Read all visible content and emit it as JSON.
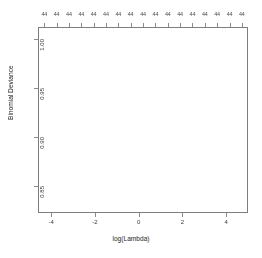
{
  "plot": {
    "xlabel": "log(Lambda)",
    "ylabel": "Binomial Deviance",
    "x_ticks": [
      "-4",
      "-2",
      "0",
      "2",
      "4"
    ],
    "x_tick_values": [
      -4,
      -2,
      0,
      2,
      4
    ],
    "y_ticks": [
      "0.85",
      "0.90",
      "0.95",
      "1.00"
    ],
    "y_tick_values": [
      0.85,
      0.9,
      0.95,
      1.0
    ],
    "top_axis_labels": [
      "44",
      "44",
      "44",
      "44",
      "44",
      "44",
      "44",
      "44",
      "44",
      "44",
      "44",
      "44",
      "44",
      "44",
      "44",
      "44",
      "44"
    ],
    "frame_color": "#7d7d7d",
    "point_color": "#1a1a1a",
    "errorbar_color": "#9d9d9d",
    "vline_color": "#8c8c8c"
  },
  "chart_data": {
    "type": "line",
    "title": "",
    "xlabel": "log(Lambda)",
    "ylabel": "Binomial Deviance",
    "xlim": [
      -4.6,
      5.0
    ],
    "ylim": [
      0.822,
      1.012
    ],
    "grid": false,
    "legend": null,
    "top_axis_label_text": "44",
    "top_axis_label_count": 17,
    "vertical_lines": [
      -4.35,
      -3.1
    ],
    "series": [
      {
        "name": "Binomial Deviance (mean CV)",
        "x": [
          -4.35,
          -4.25,
          -4.15,
          -4.05,
          -3.95,
          -3.85,
          -3.75,
          -3.65,
          -3.55,
          -3.45,
          -3.35,
          -3.25,
          -3.15,
          -3.05,
          -2.95,
          -2.85,
          -2.75,
          -2.65,
          -2.55,
          -2.45,
          -2.35,
          -2.25,
          -2.15,
          -2.05,
          -1.95,
          -1.85,
          -1.75,
          -1.65,
          -1.55,
          -1.45,
          -1.35,
          -1.25,
          -1.15,
          -1.05,
          -0.95,
          -0.85,
          -0.75,
          -0.65,
          -0.55,
          -0.45,
          -0.35,
          -0.25,
          -0.15,
          -0.05,
          0.05,
          0.15,
          0.25,
          0.35,
          0.45,
          0.55,
          0.65,
          0.75,
          0.85,
          0.95,
          1.05,
          1.15,
          1.25,
          1.35,
          1.45,
          1.55,
          1.65,
          1.75,
          1.85,
          1.95,
          2.05,
          2.2,
          2.35,
          2.5,
          2.65,
          2.8,
          2.95,
          3.1,
          3.3,
          3.5,
          3.7,
          3.9,
          4.1,
          4.3,
          4.5,
          4.7,
          4.9
        ],
        "values": [
          0.8345,
          0.8346,
          0.8347,
          0.8348,
          0.835,
          0.8352,
          0.8354,
          0.8357,
          0.836,
          0.8364,
          0.8368,
          0.8373,
          0.8379,
          0.8386,
          0.8394,
          0.8403,
          0.8413,
          0.8425,
          0.8438,
          0.8453,
          0.847,
          0.8489,
          0.851,
          0.8533,
          0.8558,
          0.8586,
          0.8616,
          0.8649,
          0.8684,
          0.8722,
          0.8762,
          0.8805,
          0.885,
          0.8897,
          0.8946,
          0.8997,
          0.9049,
          0.9103,
          0.9157,
          0.9212,
          0.9267,
          0.9322,
          0.9376,
          0.9429,
          0.948,
          0.9529,
          0.9576,
          0.962,
          0.9661,
          0.9699,
          0.9734,
          0.9765,
          0.9793,
          0.9818,
          0.984,
          0.9859,
          0.9875,
          0.9889,
          0.9901,
          0.9911,
          0.992,
          0.9927,
          0.9933,
          0.9939,
          0.9944,
          0.995,
          0.9956,
          0.9961,
          0.9965,
          0.9969,
          0.9973,
          0.9976,
          0.998,
          0.9984,
          0.9987,
          0.999,
          0.9993,
          0.9996,
          0.9999,
          1.0002,
          1.0005
        ],
        "error_low": [
          0.8262,
          0.8263,
          0.8264,
          0.8265,
          0.8267,
          0.8269,
          0.8271,
          0.8273,
          0.8276,
          0.828,
          0.8284,
          0.8289,
          0.8295,
          0.8301,
          0.8309,
          0.8317,
          0.8327,
          0.8338,
          0.835,
          0.8364,
          0.838,
          0.8398,
          0.8418,
          0.844,
          0.8464,
          0.849,
          0.8519,
          0.855,
          0.8583,
          0.8619,
          0.8657,
          0.8698,
          0.8741,
          0.8786,
          0.8833,
          0.8882,
          0.8932,
          0.8984,
          0.9036,
          0.9089,
          0.9142,
          0.9195,
          0.9247,
          0.9298,
          0.9347,
          0.9394,
          0.9439,
          0.9481,
          0.952,
          0.9556,
          0.9589,
          0.9618,
          0.9644,
          0.9667,
          0.9687,
          0.9704,
          0.9719,
          0.9731,
          0.9742,
          0.9751,
          0.9759,
          0.9765,
          0.977,
          0.9775,
          0.9779,
          0.9784,
          0.9789,
          0.9793,
          0.9797,
          0.98,
          0.9803,
          0.9806,
          0.9809,
          0.9812,
          0.9815,
          0.9818,
          0.982,
          0.9823,
          0.9825,
          0.9827,
          0.983
        ],
        "error_high": [
          0.8428,
          0.8429,
          0.843,
          0.8431,
          0.8433,
          0.8435,
          0.8437,
          0.8441,
          0.8444,
          0.8448,
          0.8452,
          0.8457,
          0.8463,
          0.8471,
          0.8479,
          0.8489,
          0.8499,
          0.8512,
          0.8526,
          0.8542,
          0.856,
          0.858,
          0.8602,
          0.8626,
          0.8652,
          0.8682,
          0.8713,
          0.8748,
          0.8785,
          0.8825,
          0.8867,
          0.8912,
          0.8959,
          0.9008,
          0.9059,
          0.9112,
          0.9166,
          0.9222,
          0.9278,
          0.9335,
          0.9392,
          0.9449,
          0.9505,
          0.956,
          0.9613,
          0.9664,
          0.9713,
          0.9759,
          0.9802,
          0.9842,
          0.9879,
          0.9912,
          0.9942,
          0.9969,
          0.9993,
          1.0014,
          1.0031,
          1.0047,
          1.006,
          1.0071,
          1.0081,
          1.0089,
          1.0096,
          1.0103,
          1.0109,
          1.0116,
          1.0123,
          1.0129,
          1.0133,
          1.0138,
          1.0143,
          1.0146,
          1.0151,
          1.0156,
          1.0159,
          1.0163,
          1.0167,
          1.017,
          1.0173,
          1.0177,
          1.018
        ]
      }
    ]
  }
}
